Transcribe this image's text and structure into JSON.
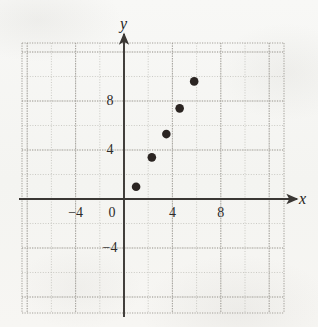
{
  "figure": {
    "name": "coordinate-plane-scatter-plot",
    "background_color": "#f7f6f3",
    "ink_color": "#2e2c2a",
    "grid_color": "#b9b7b2",
    "point_color": "#2b2522"
  },
  "axis_labels": {
    "x": "x",
    "y": "y"
  },
  "x_tick_labels": [
    {
      "text": "-4",
      "value": -4
    },
    {
      "text": "0",
      "value": 0
    },
    {
      "text": "4",
      "value": 4
    },
    {
      "text": "8",
      "value": 8
    }
  ],
  "y_tick_labels": [
    {
      "text": "8",
      "value": 8
    },
    {
      "text": "4",
      "value": 4
    },
    {
      "text": "-4",
      "value": -4
    }
  ],
  "chart_data": {
    "type": "scatter",
    "title": "",
    "xlabel": "x",
    "ylabel": "y",
    "xlim": [
      -8.4,
      13.2
    ],
    "ylim": [
      -9.4,
      12.8
    ],
    "xticks": [
      -4,
      0,
      4,
      8
    ],
    "yticks": [
      -4,
      4,
      8
    ],
    "grid": true,
    "grid_major_step": 4,
    "grid_minor_step": 2,
    "legend": "none",
    "series": [
      {
        "name": "data",
        "marker": "filled-circle",
        "color": "#2b2522",
        "points": [
          {
            "x": 1,
            "y": 1
          },
          {
            "x": 2.3,
            "y": 3.4
          },
          {
            "x": 3.5,
            "y": 5.3
          },
          {
            "x": 4.6,
            "y": 7.4
          },
          {
            "x": 5.8,
            "y": 9.6
          }
        ]
      }
    ]
  }
}
